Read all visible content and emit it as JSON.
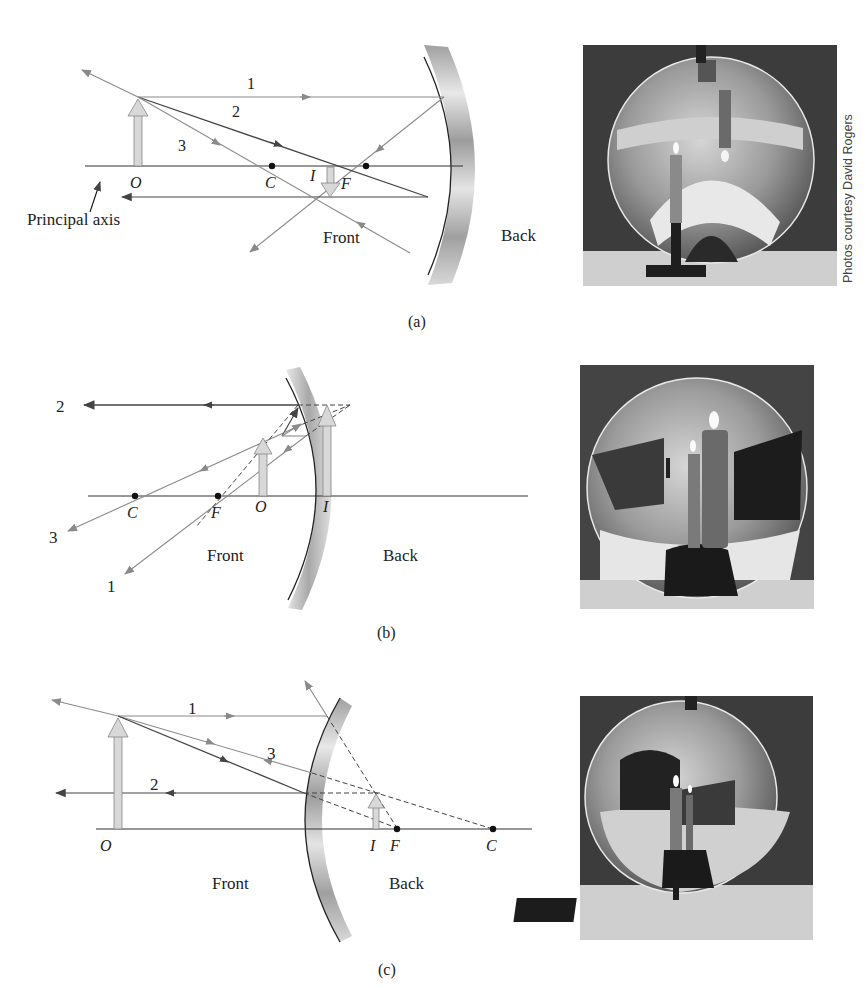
{
  "figure": {
    "credit": "Photos courtesy David Rogers",
    "panels": [
      {
        "id": "a",
        "caption": "(a)",
        "mirror_type": "concave",
        "labels": {
          "ray1": "1",
          "ray2": "2",
          "ray3": "3",
          "object": "O",
          "center": "C",
          "image": "I",
          "focal": "F",
          "principal_axis": "Principal axis",
          "front": "Front",
          "back": "Back"
        },
        "photo_alt": "Concave mirror photo showing an inverted real image of a candle"
      },
      {
        "id": "b",
        "caption": "(b)",
        "mirror_type": "concave",
        "labels": {
          "ray1": "1",
          "ray2": "2",
          "ray3": "3",
          "center": "C",
          "focal": "F",
          "object": "O",
          "image": "I",
          "front": "Front",
          "back": "Back"
        },
        "photo_alt": "Concave mirror photo showing an enlarged upright virtual image of a candle"
      },
      {
        "id": "c",
        "caption": "(c)",
        "mirror_type": "convex",
        "labels": {
          "ray1": "1",
          "ray2": "2",
          "ray3": "3",
          "object": "O",
          "image": "I",
          "focal": "F",
          "center": "C",
          "front": "Front",
          "back": "Back"
        },
        "photo_alt": "Convex mirror photo showing a diminished upright virtual image of a candle"
      }
    ]
  }
}
